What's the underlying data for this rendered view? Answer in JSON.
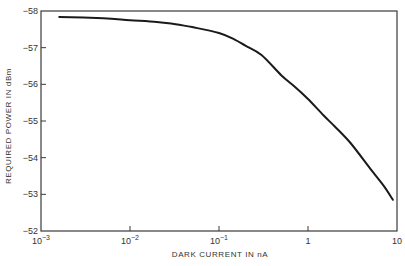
{
  "chart_data": {
    "type": "line",
    "title": "",
    "xlabel": "DARK CURRENT IN nA",
    "ylabel": "REQUIRED POWER IN dBm",
    "xscale": "log",
    "xlim": [
      0.001,
      10
    ],
    "ylim": [
      -52,
      -58
    ],
    "y_inverted": true,
    "grid": false,
    "legend": null,
    "x_ticks": [
      {
        "value": 0.001,
        "base": "10",
        "exp": "−3"
      },
      {
        "value": 0.01,
        "base": "10",
        "exp": "−2"
      },
      {
        "value": 0.1,
        "base": "10",
        "exp": "−1"
      },
      {
        "value": 1,
        "base": "1",
        "exp": ""
      },
      {
        "value": 10,
        "base": "10",
        "exp": ""
      }
    ],
    "y_ticks": [
      {
        "value": -58,
        "label": "−58"
      },
      {
        "value": -57,
        "label": "−57"
      },
      {
        "value": -56,
        "label": "−56"
      },
      {
        "value": -55,
        "label": "−55"
      },
      {
        "value": -54,
        "label": "−54"
      },
      {
        "value": -53,
        "label": "−53"
      },
      {
        "value": -52,
        "label": "−52"
      }
    ],
    "series": [
      {
        "name": "Required power",
        "color": "#1a1a1a",
        "x": [
          0.0016,
          0.005,
          0.01,
          0.02,
          0.03,
          0.05,
          0.1,
          0.15,
          0.2,
          0.3,
          0.5,
          0.7,
          1,
          1.5,
          2,
          3,
          5,
          7,
          9
        ],
        "y": [
          -57.84,
          -57.8,
          -57.75,
          -57.7,
          -57.65,
          -57.56,
          -57.4,
          -57.22,
          -57.05,
          -56.8,
          -56.25,
          -55.95,
          -55.6,
          -55.15,
          -54.85,
          -54.4,
          -53.7,
          -53.25,
          -52.85
        ]
      }
    ]
  }
}
